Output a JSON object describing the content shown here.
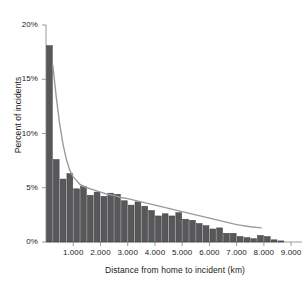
{
  "chart_data": {
    "type": "bar",
    "title": "",
    "xlabel": "Distance from home to incident (km)",
    "ylabel": "Percent of incidents",
    "xlim": [
      0,
      9400
    ],
    "ylim": [
      0,
      20
    ],
    "grid": false,
    "legend": "none",
    "bar_color": "#58585a",
    "line_color": "#9a9a9a",
    "axis_color": "#9a9a9a",
    "bin_width": 250,
    "y_ticks": [
      0,
      5,
      10,
      15,
      20
    ],
    "y_tick_labels": [
      "0%",
      "5%",
      "10%",
      "15%",
      "20%"
    ],
    "x_ticks": [
      1000,
      2000,
      3000,
      4000,
      5000,
      6000,
      7000,
      8000,
      9000
    ],
    "x_tick_labels": [
      "1.000",
      "2.000",
      "3.000",
      "4.000",
      "5.000",
      "6.000",
      "7.000",
      "8.000",
      "9.000"
    ],
    "categories": [
      125,
      375,
      625,
      875,
      1125,
      1375,
      1625,
      1875,
      2125,
      2375,
      2625,
      2875,
      3125,
      3375,
      3625,
      3875,
      4125,
      4375,
      4625,
      4875,
      5125,
      5375,
      5625,
      5875,
      6125,
      6375,
      6625,
      6875,
      7125,
      7375,
      7625,
      7875,
      8125,
      8375,
      8625
    ],
    "values": [
      18.1,
      7.6,
      5.8,
      6.3,
      4.9,
      5.1,
      4.3,
      4.6,
      4.2,
      4.5,
      4.4,
      3.8,
      3.4,
      3.7,
      3.3,
      2.9,
      2.4,
      2.6,
      2.4,
      2.7,
      2.1,
      2.0,
      1.7,
      1.5,
      1.2,
      1.3,
      0.8,
      0.8,
      0.5,
      0.4,
      0.3,
      0.6,
      0.5,
      0.2,
      0.1
    ],
    "series": [
      {
        "name": "overlay-line",
        "type": "line",
        "x": [
          250,
          375,
          500,
          625,
          750,
          875,
          1000,
          1250,
          1500,
          1750,
          2000,
          2250,
          2500,
          2750,
          3000,
          3500,
          4000,
          4500,
          5000,
          5500,
          6000,
          6500,
          7000,
          7500,
          7900
        ],
        "y": [
          16.3,
          13.4,
          10.9,
          9.0,
          7.6,
          6.6,
          6.0,
          5.3,
          5.0,
          4.8,
          4.6,
          4.4,
          4.3,
          4.1,
          4.0,
          3.7,
          3.4,
          3.1,
          2.8,
          2.5,
          2.2,
          1.9,
          1.6,
          1.4,
          1.3
        ]
      }
    ]
  }
}
